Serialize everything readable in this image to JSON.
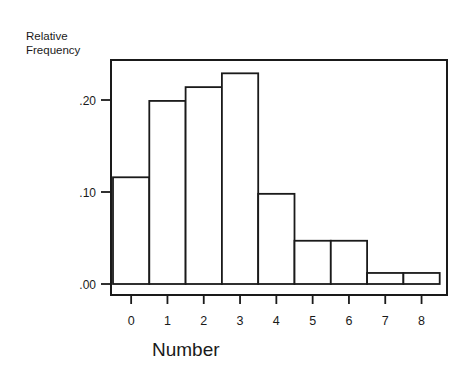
{
  "chart_data": {
    "type": "bar",
    "title": "",
    "xlabel": "Number",
    "ylabel": "Relative Frequency",
    "ylabel_lines": [
      "Relative",
      "Frequency"
    ],
    "categories": [
      "0",
      "1",
      "2",
      "3",
      "4",
      "5",
      "6",
      "7",
      "8"
    ],
    "values": [
      0.116,
      0.199,
      0.214,
      0.229,
      0.098,
      0.047,
      0.047,
      0.012,
      0.012
    ],
    "ylim": [
      0,
      0.25
    ],
    "yticks": [
      0.0,
      0.1,
      0.2
    ],
    "ytick_labels": [
      ".00",
      ".10",
      ".20"
    ],
    "grid": false,
    "legend": null,
    "style": {
      "bar_fill": "#ffffff",
      "bar_edge": "#1a1a1a"
    }
  }
}
